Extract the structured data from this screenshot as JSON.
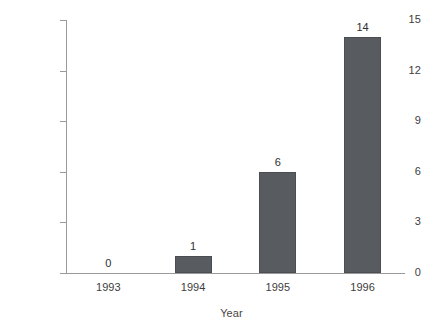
{
  "chart_data": {
    "type": "bar",
    "title": "",
    "xlabel": "Year",
    "ylabel": "Resistant Isolates, percent",
    "categories": [
      "1993",
      "1994",
      "1995",
      "1996"
    ],
    "values": [
      0,
      1,
      6,
      14
    ],
    "data_labels": [
      "0",
      "1",
      "6",
      "14"
    ],
    "yticks": [
      0,
      3,
      6,
      9,
      12,
      15
    ],
    "ytick_labels": [
      "0",
      "3",
      "6",
      "9",
      "12",
      "15"
    ],
    "ylim": [
      0,
      15
    ],
    "grid": false,
    "legend": null,
    "bar_color": "#585c60",
    "bar_edge_color": "#4a4e52",
    "axis_color": "#9a9a9a",
    "text_color": "#3d3d3d",
    "background": "#ffffff"
  }
}
